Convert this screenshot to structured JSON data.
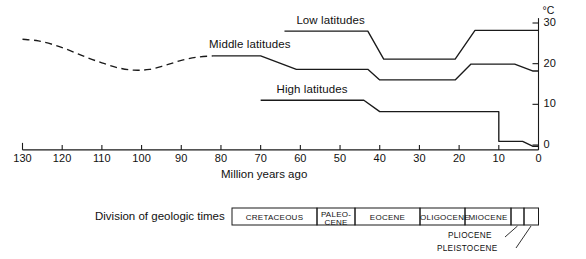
{
  "chart_data": {
    "type": "line",
    "title": "",
    "xlabel": "Million years ago",
    "ylabel": "",
    "yunit": "°C",
    "xlim": [
      130,
      0
    ],
    "ylim": [
      -3,
      32
    ],
    "x_reversed": true,
    "grid": false,
    "legend": "inline-annotations",
    "xticks": [
      130,
      120,
      110,
      100,
      90,
      80,
      70,
      60,
      50,
      40,
      30,
      20,
      10,
      0
    ],
    "xtick_labels": [
      "130",
      "120",
      "110",
      "100",
      "90",
      "80",
      "70",
      "60",
      "50",
      "40",
      "30",
      "20",
      "10",
      "0"
    ],
    "yticks": [
      0,
      10,
      20,
      30
    ],
    "ytick_labels": [
      "0",
      "10",
      "20",
      "30"
    ],
    "series": [
      {
        "name": "Middle latitudes",
        "style": "dashed-then-solid",
        "dashed_points": [
          [
            130,
            26.0
          ],
          [
            126,
            25.6
          ],
          [
            122,
            24.6
          ],
          [
            118,
            23.2
          ],
          [
            114,
            21.6
          ],
          [
            110,
            20.2
          ],
          [
            106,
            19.0
          ],
          [
            102,
            18.4
          ],
          [
            98,
            18.6
          ],
          [
            94,
            19.6
          ],
          [
            90,
            20.8
          ],
          [
            86,
            21.6
          ],
          [
            82,
            21.9
          ]
        ],
        "solid_points": [
          [
            82,
            21.9
          ],
          [
            70,
            21.9
          ],
          [
            61,
            18.6
          ],
          [
            43,
            18.6
          ],
          [
            40,
            16.0
          ],
          [
            21,
            16.0
          ],
          [
            17,
            19.9
          ],
          [
            6,
            19.9
          ],
          [
            1.5,
            18.2
          ],
          [
            0,
            18.2
          ]
        ]
      },
      {
        "name": "Low latitudes",
        "style": "solid",
        "solid_points": [
          [
            64,
            28.0
          ],
          [
            43,
            28.0
          ],
          [
            39,
            21.1
          ],
          [
            21,
            21.1
          ],
          [
            16,
            28.2
          ],
          [
            0,
            28.2
          ]
        ]
      },
      {
        "name": "High latitudes",
        "style": "solid",
        "solid_points": [
          [
            70,
            11.0
          ],
          [
            44,
            11.0
          ],
          [
            40,
            8.2
          ],
          [
            10,
            8.2
          ],
          [
            10,
            0.9
          ],
          [
            4,
            0.9
          ],
          [
            1.5,
            -0.3
          ],
          [
            0,
            -0.3
          ]
        ]
      }
    ],
    "annotations": [
      {
        "text": "Middle latitudes",
        "x": 83,
        "y": 24.5
      },
      {
        "text": "Low latitudes",
        "x": 61,
        "y": 30.5
      },
      {
        "text": "High latitudes",
        "x": 66,
        "y": 13.5
      }
    ]
  },
  "axes": {
    "x_title": "Million years ago",
    "y_unit": "°C"
  },
  "geologic": {
    "title": "Division of geologic times",
    "epochs": [
      {
        "label": "CRETACEOUS",
        "start": 130,
        "end": 65
      },
      {
        "label": "PALEO-\nCENE",
        "label_line1": "PALEO-",
        "label_line2": "CENE",
        "start": 65,
        "end": 54
      },
      {
        "label": "EOCENE",
        "start": 54,
        "end": 37
      },
      {
        "label": "OLIGOCENE",
        "start": 37,
        "end": 24
      },
      {
        "label": "MIOCENE",
        "start": 24,
        "end": 5
      },
      {
        "label": "",
        "start": 5,
        "end": 2
      },
      {
        "label": "",
        "start": 2,
        "end": 0
      }
    ],
    "callouts": [
      {
        "text": "PLIOCENE"
      },
      {
        "text": "PLEISTOCENE"
      }
    ]
  },
  "colors": {
    "ink": "#1a1a1a",
    "background": "#ffffff"
  }
}
